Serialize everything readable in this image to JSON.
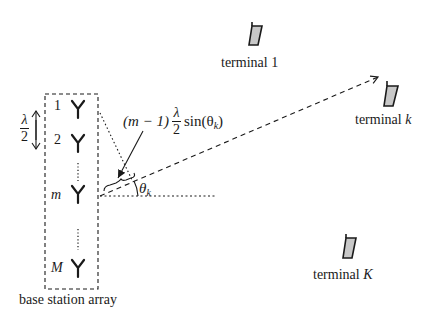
{
  "diagram": {
    "array_label": "base station array",
    "spacing": {
      "numerator": "λ",
      "denominator": "2"
    },
    "antennas": [
      {
        "index_label": "1",
        "italic": false
      },
      {
        "index_label": "2",
        "italic": false
      },
      {
        "index_label": "m",
        "italic": true
      },
      {
        "index_label": "M",
        "italic": true
      }
    ],
    "path_difference": {
      "prefix": "(m − 1)",
      "frac_num": "λ",
      "frac_den": "2",
      "func": "sin(θ",
      "sub": "k",
      "suffix": ")"
    },
    "angle": {
      "symbol": "θ",
      "sub": "k"
    },
    "terminals": [
      {
        "name": "terminal 1",
        "base": "terminal ",
        "index": "1",
        "index_italic": false,
        "fill": "#c8c8c8"
      },
      {
        "name": "terminal k",
        "base": "terminal ",
        "index": "k",
        "index_italic": true,
        "fill": "#c8c8c8"
      },
      {
        "name": "terminal K",
        "base": "terminal ",
        "index": "K",
        "index_italic": true,
        "fill": "#c8c8c8"
      }
    ],
    "colors": {
      "stroke": "#1a1a1a",
      "phone_fill": "#c8c8c8",
      "background": "#ffffff"
    }
  }
}
